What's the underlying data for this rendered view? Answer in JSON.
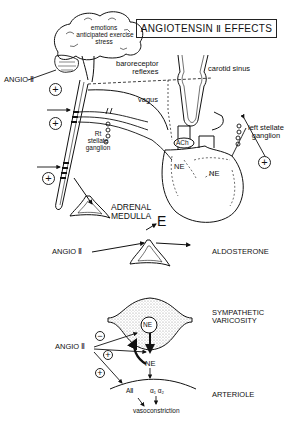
{
  "title": "ANGIOTENSIN Ⅱ EFFECTS",
  "brain": {
    "lines": [
      "emotions",
      "anticipated exercise",
      "stress"
    ]
  },
  "top_panel": {
    "angio_label": "ANGIO Ⅱ",
    "baroreceptor_label": [
      "baroreceptor",
      "reflexes"
    ],
    "carotid_sinus_label": "carotid sinus",
    "vagus_label": "vagus",
    "rt_stellate_label": [
      "Rt",
      "stellate",
      "ganglion"
    ],
    "left_stellate_label": [
      "left stellate",
      "ganglion"
    ],
    "ach_label": "ACh",
    "ne_labels": [
      "NE",
      "NE"
    ],
    "adrenal_label": [
      "ADRENAL",
      "MEDULLA"
    ],
    "epinephrine_label": "E",
    "plus_signs": [
      "+",
      "+",
      "+",
      "+"
    ]
  },
  "middle_panel": {
    "angio_label": "ANGIO Ⅱ",
    "aldosterone_label": "ALDOSTERONE"
  },
  "bottom_panel": {
    "varicosity_label": [
      "SYMPATHETIC",
      "VARICOSITY"
    ],
    "ne_vesicle_label": "NE",
    "ne_released_label": "NE",
    "angio_label": "ANGIO Ⅱ",
    "minus_sign": "−",
    "plus_signs": [
      "+",
      "+"
    ],
    "arteriole_label": "ARTERIOLE",
    "receptor_aii_label": "AⅡ",
    "receptor_alpha_label": "α₁ α₂",
    "vasoconstriction_label": "vasoconstriction"
  },
  "colors": {
    "ink": "#111111",
    "background": "#ffffff",
    "stipple": "#bdbdbd"
  }
}
